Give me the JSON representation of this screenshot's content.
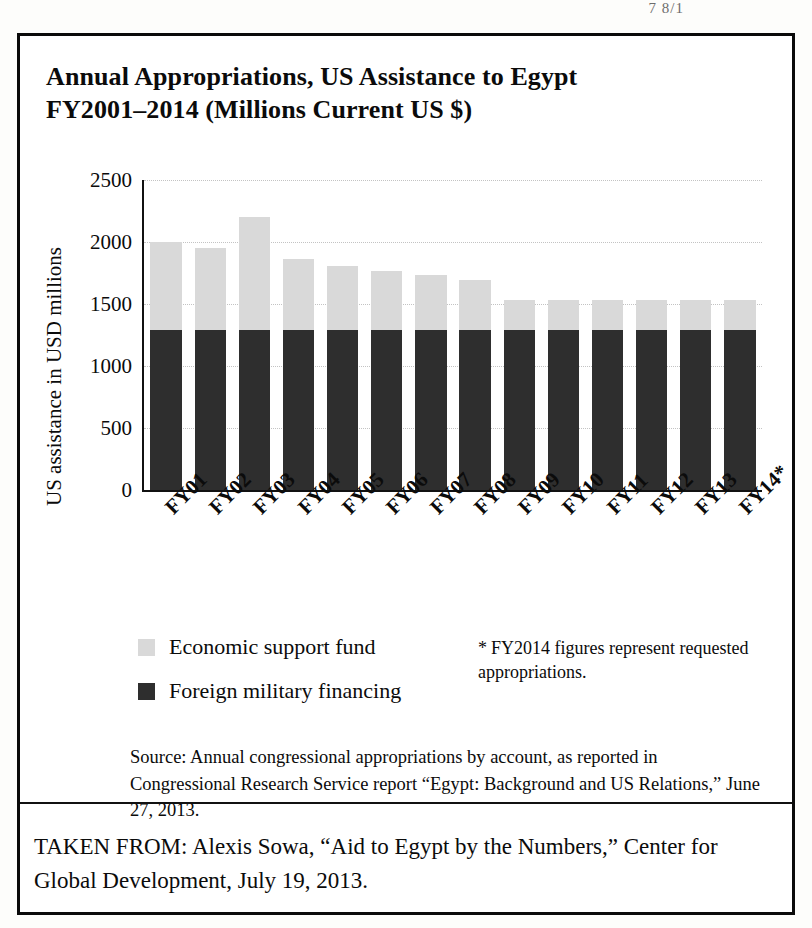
{
  "page_header_fragment": "7      8/1",
  "figure": {
    "title": "Annual Appropriations, US Assistance to Egypt FY2001–2014 (Millions Current US $)",
    "title_line_1": "Annual Appropriations, US Assistance to Egypt",
    "title_line_2": "FY2001–2014 (Millions Current US $)",
    "footnote_star": "*",
    "footnote_text": "FY2014 figures represent requested appropriations.",
    "source_text": "Source: Annual congressional appropriations by account, as reported in Congressional Research Service report “Egypt: Background and US Relations,” June 27, 2013.",
    "taken_from": "TAKEN FROM: Alexis Sowa, “Aid to Egypt by the Numbers,” Center for Global Development, July 19, 2013."
  },
  "colors": {
    "economic_support_fund": "#d9d9d9",
    "foreign_military_financing": "#2e2e2e",
    "frame": "#0a0a0a",
    "gridline": "#c3c3c3"
  },
  "chart_data": {
    "type": "bar",
    "stacked": true,
    "title": "Annual Appropriations, US Assistance to Egypt FY2001–2014 (Millions Current US $)",
    "xlabel": "",
    "ylabel": "US assistance in USD millions",
    "ylim": [
      0,
      2500
    ],
    "yticks": [
      0,
      500,
      1000,
      1500,
      2000,
      2500
    ],
    "ytick_labels": [
      "0",
      "500",
      "1000",
      "1500",
      "2000",
      "2500"
    ],
    "grid": true,
    "grid_axis": "y",
    "legend_position": "below-left",
    "categories": [
      "FY01",
      "FY02",
      "FY03",
      "FY04",
      "FY05",
      "FY06",
      "FY07",
      "FY08",
      "FY09",
      "FY10",
      "FY11",
      "FY12",
      "FY13",
      "FY14*"
    ],
    "series": [
      {
        "name": "Foreign military financing",
        "color": "#2e2e2e",
        "values": [
          1290,
          1290,
          1290,
          1290,
          1290,
          1290,
          1290,
          1290,
          1290,
          1290,
          1290,
          1290,
          1290,
          1290
        ]
      },
      {
        "name": "Economic support fund",
        "color": "#d9d9d9",
        "values": [
          710,
          665,
          910,
          570,
          520,
          475,
          445,
          400,
          240,
          240,
          240,
          240,
          240,
          240
        ]
      }
    ],
    "totals": [
      2000,
      1955,
      2200,
      1860,
      1810,
      1765,
      1735,
      1690,
      1530,
      1530,
      1530,
      1530,
      1530,
      1530
    ],
    "annotations": [
      "* FY2014 figures represent requested appropriations."
    ]
  },
  "legend": {
    "items": [
      {
        "label": "Economic support fund",
        "key": "esf"
      },
      {
        "label": "Foreign military financing",
        "key": "fmf"
      }
    ]
  }
}
